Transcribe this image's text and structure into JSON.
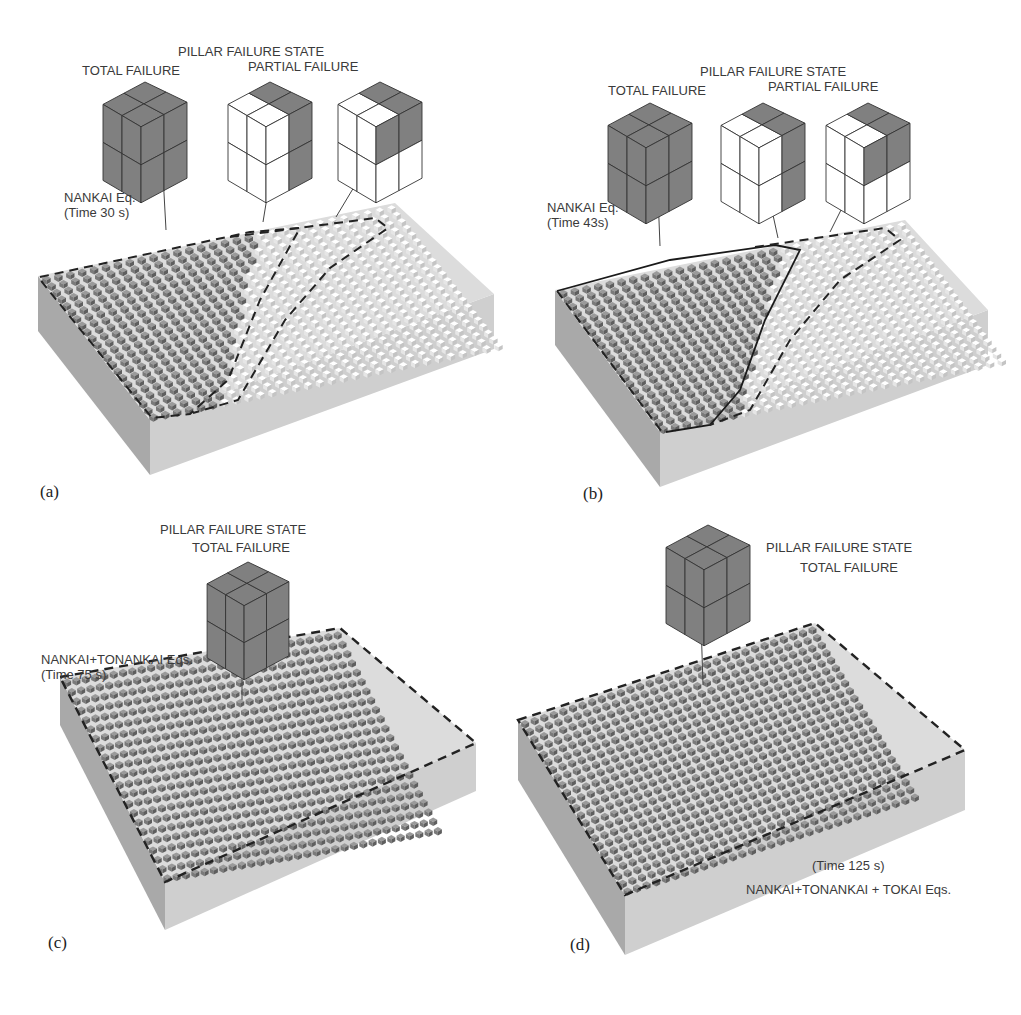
{
  "figure": {
    "panels": [
      {
        "id": "a",
        "tag": "(a)",
        "legend_title": "PILLAR FAILURE  STATE",
        "legend_items": [
          "TOTAL FAILURE",
          "PARTIAL FAILURE"
        ],
        "event_label": "NANKAI Eq.",
        "time_label": "(Time 30 s)",
        "cubes": [
          "total",
          "partial-half",
          "partial-quarter"
        ]
      },
      {
        "id": "b",
        "tag": "(b)",
        "legend_title": "PILLAR FAILURE  STATE",
        "legend_items": [
          "TOTAL FAILURE",
          "PARTIAL FAILURE"
        ],
        "event_label": "NANKAI Eq.",
        "time_label": "(Time 43s)",
        "cubes": [
          "total",
          "partial-half",
          "partial-quarter"
        ]
      },
      {
        "id": "c",
        "tag": "(c)",
        "legend_title": "PILLAR FAILURE  STATE",
        "legend_items": [
          "TOTAL FAILURE"
        ],
        "event_label": "NANKAI+TONANKAI Eqs.",
        "time_label": "(Time 75 s)",
        "cubes": [
          "total"
        ]
      },
      {
        "id": "d",
        "tag": "(d)",
        "legend_title": "PILLAR FAILURE  STATE",
        "legend_items": [
          "TOTAL FAILURE"
        ],
        "event_label": "NANKAI+TONANKAI + TOKAI Eqs.",
        "time_label": "(Time 125 s)",
        "cubes": [
          "total"
        ]
      }
    ],
    "colors": {
      "failed_pillar": "#7a7a7a",
      "intact_pillar": "#e6e6e6",
      "block_side": "#cfcfcf",
      "block_side_dark": "#a9a9a9",
      "dashed_boundary": "#222222",
      "cube_total": "#808080",
      "cube_intact": "#ffffff"
    }
  }
}
